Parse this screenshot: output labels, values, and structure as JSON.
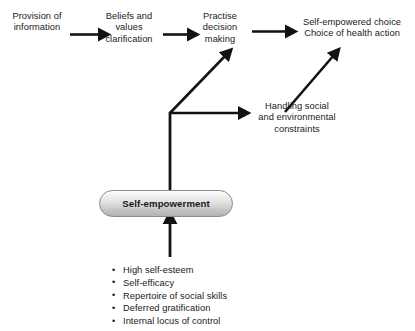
{
  "diagram": {
    "nodes": {
      "provision": "Provision of\ninformation",
      "beliefs": "Beliefs and\nvalues\nclarification",
      "practise": "Practise\ndecision\nmaking",
      "outcome": "Self-empowered choice\nChoice of health action",
      "handling": "Handling social\nand environmental\nconstraints",
      "empowerment": "Self-empowerment"
    },
    "attributes": {
      "items": [
        "High self-esteem",
        "Self-efficacy",
        "Repertoire of social skills",
        "Deferred gratification",
        "Internal locus of control"
      ]
    },
    "connectors": [
      {
        "name": "provision-to-beliefs",
        "kind": "arrow-right"
      },
      {
        "name": "beliefs-to-practise",
        "kind": "arrow-right"
      },
      {
        "name": "practise-to-outcome",
        "kind": "arrow-right"
      },
      {
        "name": "junction-to-practise",
        "kind": "arrow-diagonal-up-right"
      },
      {
        "name": "junction-to-handling",
        "kind": "arrow-right"
      },
      {
        "name": "handling-to-outcome",
        "kind": "arrow-diagonal-up-right"
      },
      {
        "name": "empowerment-to-junction",
        "kind": "line-vertical"
      },
      {
        "name": "attributes-to-empowerment",
        "kind": "arrow-up"
      }
    ],
    "colors": {
      "stroke": "#121212",
      "text": "#1a1a1a",
      "box_border": "#8b8b8b",
      "box_fill_top": "#fdfdfd",
      "box_fill_bottom": "#b4b4b4",
      "background": "#ffffff"
    }
  }
}
